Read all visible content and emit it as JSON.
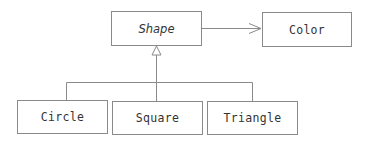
{
  "diagram": {
    "type": "uml-class-diagram",
    "colors": {
      "stroke": "#8a8a8a",
      "text": "#333333",
      "background": "#ffffff"
    },
    "classes": {
      "shape": {
        "label": "Shape",
        "abstract": true
      },
      "color": {
        "label": "Color",
        "abstract": false
      },
      "circle": {
        "label": "Circle",
        "abstract": false
      },
      "square": {
        "label": "Square",
        "abstract": false
      },
      "triangle": {
        "label": "Triangle",
        "abstract": false
      }
    },
    "relationships": [
      {
        "type": "association",
        "from": "Shape",
        "to": "Color",
        "arrow": "open"
      },
      {
        "type": "generalization",
        "from": "Circle",
        "to": "Shape",
        "arrow": "hollow-triangle"
      },
      {
        "type": "generalization",
        "from": "Square",
        "to": "Shape",
        "arrow": "hollow-triangle"
      },
      {
        "type": "generalization",
        "from": "Triangle",
        "to": "Shape",
        "arrow": "hollow-triangle"
      }
    ]
  }
}
